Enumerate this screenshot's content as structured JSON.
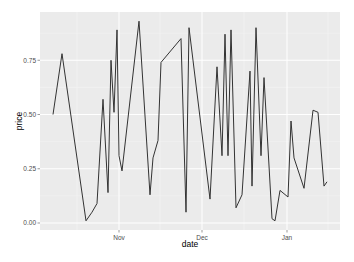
{
  "chart_data": {
    "type": "line",
    "title": "",
    "xlabel": "date",
    "ylabel": "price",
    "ylim": [
      -0.03,
      0.97
    ],
    "grid": true,
    "legend": "none",
    "x_ticks": [
      {
        "label": "Nov",
        "px": 119
      },
      {
        "label": "Dec",
        "px": 202
      },
      {
        "label": "Jan",
        "px": 287
      }
    ],
    "y_ticks": [
      {
        "label": "0.00",
        "value": 0.0
      },
      {
        "label": "0.25",
        "value": 0.25
      },
      {
        "label": "0.50",
        "value": 0.5
      },
      {
        "label": "0.75",
        "value": 0.75
      }
    ],
    "series": [
      {
        "name": "price",
        "color": "#333333",
        "points": [
          {
            "x": 53,
            "y": 0.5
          },
          {
            "x": 62,
            "y": 0.78
          },
          {
            "x": 86,
            "y": 0.01
          },
          {
            "x": 92,
            "y": 0.05
          },
          {
            "x": 97,
            "y": 0.09
          },
          {
            "x": 103,
            "y": 0.57
          },
          {
            "x": 108,
            "y": 0.14
          },
          {
            "x": 111,
            "y": 0.75
          },
          {
            "x": 114,
            "y": 0.51
          },
          {
            "x": 117,
            "y": 0.89
          },
          {
            "x": 119,
            "y": 0.31
          },
          {
            "x": 122,
            "y": 0.24
          },
          {
            "x": 139,
            "y": 0.93
          },
          {
            "x": 150,
            "y": 0.13
          },
          {
            "x": 153,
            "y": 0.3
          },
          {
            "x": 158,
            "y": 0.38
          },
          {
            "x": 161,
            "y": 0.74
          },
          {
            "x": 181,
            "y": 0.85
          },
          {
            "x": 186,
            "y": 0.05
          },
          {
            "x": 189,
            "y": 0.9
          },
          {
            "x": 210,
            "y": 0.11
          },
          {
            "x": 217,
            "y": 0.72
          },
          {
            "x": 222,
            "y": 0.31
          },
          {
            "x": 225,
            "y": 0.87
          },
          {
            "x": 228,
            "y": 0.31
          },
          {
            "x": 231,
            "y": 0.89
          },
          {
            "x": 236,
            "y": 0.07
          },
          {
            "x": 242,
            "y": 0.13
          },
          {
            "x": 250,
            "y": 0.7
          },
          {
            "x": 252,
            "y": 0.17
          },
          {
            "x": 256,
            "y": 0.9
          },
          {
            "x": 261,
            "y": 0.31
          },
          {
            "x": 264,
            "y": 0.67
          },
          {
            "x": 272,
            "y": 0.02
          },
          {
            "x": 275,
            "y": 0.01
          },
          {
            "x": 280,
            "y": 0.15
          },
          {
            "x": 288,
            "y": 0.12
          },
          {
            "x": 291,
            "y": 0.47
          },
          {
            "x": 294,
            "y": 0.3
          },
          {
            "x": 304,
            "y": 0.16
          },
          {
            "x": 313,
            "y": 0.52
          },
          {
            "x": 318,
            "y": 0.51
          },
          {
            "x": 324,
            "y": 0.17
          },
          {
            "x": 327,
            "y": 0.19
          }
        ]
      }
    ]
  },
  "style": {
    "panel_bg": "#EBEBEB",
    "grid_major": "#FFFFFF",
    "grid_minor": "#F5F5F5",
    "axis_tick": "#333333"
  },
  "layout": {
    "panel": {
      "x": 40,
      "y": 12,
      "w": 300,
      "h": 218
    },
    "y_zero_px": 223,
    "y_px_per_unit": 217,
    "x_minor_px": [
      77,
      160,
      244,
      328
    ],
    "y_minor_values": [
      0.125,
      0.375,
      0.625,
      0.875
    ]
  }
}
